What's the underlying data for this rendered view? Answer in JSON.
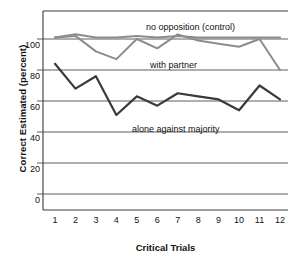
{
  "chart_data": {
    "type": "line",
    "title": "",
    "xlabel": "Critical Trials",
    "ylabel": "Correct Estimated (percent)",
    "x": [
      1,
      2,
      3,
      4,
      5,
      6,
      7,
      8,
      9,
      10,
      11,
      12
    ],
    "xtick_labels": [
      "1",
      "2",
      "3",
      "4",
      "5",
      "6",
      "7",
      "8",
      "9",
      "10",
      "11",
      "12"
    ],
    "ytick_labels": [
      "0",
      "20",
      "40",
      "60",
      "80",
      "100"
    ],
    "yticks": [
      0,
      20,
      40,
      60,
      80,
      100
    ],
    "ylim": [
      0,
      112
    ],
    "xlim": [
      0.5,
      12.5
    ],
    "grid": "horizontal",
    "legend_position": "inline-annotations",
    "series": [
      {
        "name": "no opposition (control)",
        "color": "#8c8c8c",
        "label_text": "no opposition (control)",
        "values": [
          101,
          103,
          101,
          101,
          102,
          101,
          102,
          101,
          101,
          101,
          101,
          101
        ]
      },
      {
        "name": "with partner",
        "color": "#8c8c8c",
        "label_text": "with partner",
        "values": [
          101,
          102,
          92,
          87,
          100,
          94,
          103,
          99,
          97,
          95,
          100,
          80
        ]
      },
      {
        "name": "alone against majority",
        "color": "#3a3a3a",
        "label_text": "alone against majority",
        "values": [
          84,
          68,
          76,
          51,
          63,
          57,
          65,
          63,
          61,
          54,
          70,
          61
        ]
      }
    ]
  },
  "axes": {
    "y_title": "Correct Estimated (percent)",
    "x_title": "Critical Trials"
  },
  "colors": {
    "gridline": "#4d4d4d",
    "axis": "#3a3a3a",
    "control_line": "#8c8c8c",
    "partner_line": "#8c8c8c",
    "alone_line": "#3a3a3a",
    "background": "#ffffff",
    "text": "#111111"
  }
}
